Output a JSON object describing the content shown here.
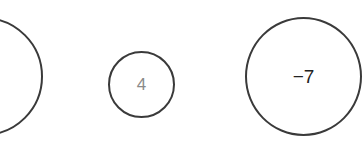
{
  "diagram": {
    "nodes": [
      {
        "id": "a",
        "label": "",
        "shape": "circle",
        "partially_visible": true
      },
      {
        "id": "b",
        "label": "4",
        "shape": "circle",
        "label_color": "#8a8a8a"
      },
      {
        "id": "c",
        "label": "−7",
        "shape": "circle",
        "label_color": "#222222"
      }
    ],
    "stroke_color": "#3a3a3a",
    "background": "#ffffff"
  }
}
